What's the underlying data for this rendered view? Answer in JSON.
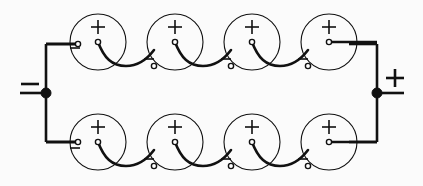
{
  "diagram": {
    "title": "Eight cells connected in two parallel strings of four series cells",
    "type": "circuit-schematic",
    "width": 423,
    "height": 186,
    "background_color": "#fbfbfb",
    "line_color": "#111111",
    "cell_outline_color": "#111111"
  },
  "terminals": {
    "negative": {
      "label": "−",
      "name": "negative-output-terminal",
      "side": "left",
      "node_x": 46,
      "node_y": 93
    },
    "positive": {
      "label": "+",
      "name": "positive-output-terminal",
      "side": "right",
      "node_x": 377,
      "node_y": 93
    }
  },
  "cell_labels": {
    "plus": "+",
    "minus": "−"
  },
  "strings": [
    {
      "name": "top-string",
      "row": "top",
      "cell_count": 4,
      "center_y": 42,
      "cells": [
        {
          "index": 1,
          "cx": 98,
          "cy": 42,
          "r": 28,
          "plus_label": "+",
          "minus_label": "−"
        },
        {
          "index": 2,
          "cx": 175,
          "cy": 42,
          "r": 28,
          "plus_label": "+",
          "minus_label": "−"
        },
        {
          "index": 3,
          "cx": 252,
          "cy": 42,
          "r": 28,
          "plus_label": "+",
          "minus_label": "−"
        },
        {
          "index": 4,
          "cx": 329,
          "cy": 42,
          "r": 28,
          "plus_label": "+",
          "minus_label": "−"
        }
      ]
    },
    {
      "name": "bottom-string",
      "row": "bottom",
      "cell_count": 4,
      "center_y": 142,
      "cells": [
        {
          "index": 1,
          "cx": 98,
          "cy": 142,
          "r": 28,
          "plus_label": "+",
          "minus_label": "−"
        },
        {
          "index": 2,
          "cx": 175,
          "cy": 142,
          "r": 28,
          "plus_label": "+",
          "minus_label": "−"
        },
        {
          "index": 3,
          "cx": 252,
          "cy": 142,
          "r": 28,
          "plus_label": "+",
          "minus_label": "−"
        },
        {
          "index": 4,
          "cx": 329,
          "cy": 142,
          "r": 28,
          "plus_label": "+",
          "minus_label": "−"
        }
      ]
    }
  ]
}
